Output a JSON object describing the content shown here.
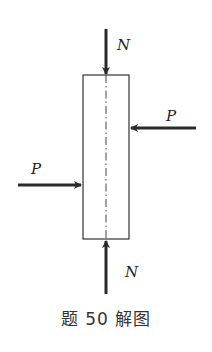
{
  "diagram": {
    "caption": "题 50 解图",
    "column": {
      "x": 83,
      "y": 75,
      "width": 46,
      "height": 164,
      "stroke": "#333333"
    },
    "centerline": {
      "x": 106,
      "y1": 75,
      "y2": 239,
      "style": "dash-dot"
    },
    "forces": [
      {
        "id": "top-N",
        "label": "N",
        "direction": "down",
        "x1": 106,
        "y1": 29,
        "x2": 106,
        "y2": 74,
        "label_x": 118,
        "label_y": 50
      },
      {
        "id": "bottom-N",
        "label": "N",
        "direction": "up",
        "x1": 106,
        "y1": 294,
        "x2": 106,
        "y2": 240,
        "label_x": 126,
        "label_y": 277
      },
      {
        "id": "right-P",
        "label": "P",
        "direction": "left",
        "x1": 196,
        "y1": 128,
        "x2": 130,
        "y2": 128,
        "label_x": 168,
        "label_y": 121
      },
      {
        "id": "left-P",
        "label": "P",
        "direction": "right",
        "x1": 18,
        "y1": 185,
        "x2": 82,
        "y2": 185,
        "label_x": 32,
        "label_y": 174
      }
    ],
    "arrow_color": "#2a2a2a"
  }
}
